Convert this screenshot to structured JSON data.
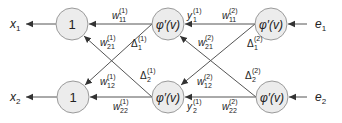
{
  "colors": {
    "node_fill": "#ececec",
    "node_stroke": "#9a9a9a",
    "edge": "#555555",
    "text": "#222222"
  },
  "nodes": {
    "left_top": {
      "label": "1"
    },
    "left_bottom": {
      "label": "1"
    },
    "mid_top": {
      "label": "φ′(v)"
    },
    "mid_bottom": {
      "label": "φ′(v)"
    },
    "right_top": {
      "label": "φ′(v)"
    },
    "right_bottom": {
      "label": "φ′(v)"
    }
  },
  "outputs": {
    "x1": {
      "base": "x",
      "sub": "1"
    },
    "x2": {
      "base": "x",
      "sub": "2"
    }
  },
  "inputs": {
    "e1": {
      "base": "e",
      "sub": "1"
    },
    "e2": {
      "base": "e",
      "sub": "2"
    }
  },
  "edge_labels": {
    "w11_1": {
      "base": "w",
      "sub": "11",
      "sup": "(1)"
    },
    "w21_1": {
      "base": "w",
      "sub": "21",
      "sup": "(1)"
    },
    "w12_1": {
      "base": "w",
      "sub": "12",
      "sup": "(1)"
    },
    "w22_1": {
      "base": "w",
      "sub": "22",
      "sup": "(1)"
    },
    "w11_2": {
      "base": "w",
      "sub": "11",
      "sup": "(2)"
    },
    "w21_2": {
      "base": "w",
      "sub": "21",
      "sup": "(2)"
    },
    "w12_2": {
      "base": "w",
      "sub": "12",
      "sup": "(2)"
    },
    "w22_2": {
      "base": "w",
      "sub": "22",
      "sup": "(2)"
    },
    "delta1_1": {
      "base": "Δ",
      "sub": "1",
      "sup": "(1)"
    },
    "delta2_1": {
      "base": "Δ",
      "sub": "2",
      "sup": "(1)"
    },
    "delta1_2": {
      "base": "Δ",
      "sub": "1",
      "sup": "(2)"
    },
    "delta2_2": {
      "base": "Δ",
      "sub": "2",
      "sup": "(2)"
    },
    "y1_1": {
      "base": "y",
      "sub": "1",
      "sup": "(1)"
    },
    "y2_1": {
      "base": "y",
      "sub": "2",
      "sup": "(1)"
    }
  }
}
